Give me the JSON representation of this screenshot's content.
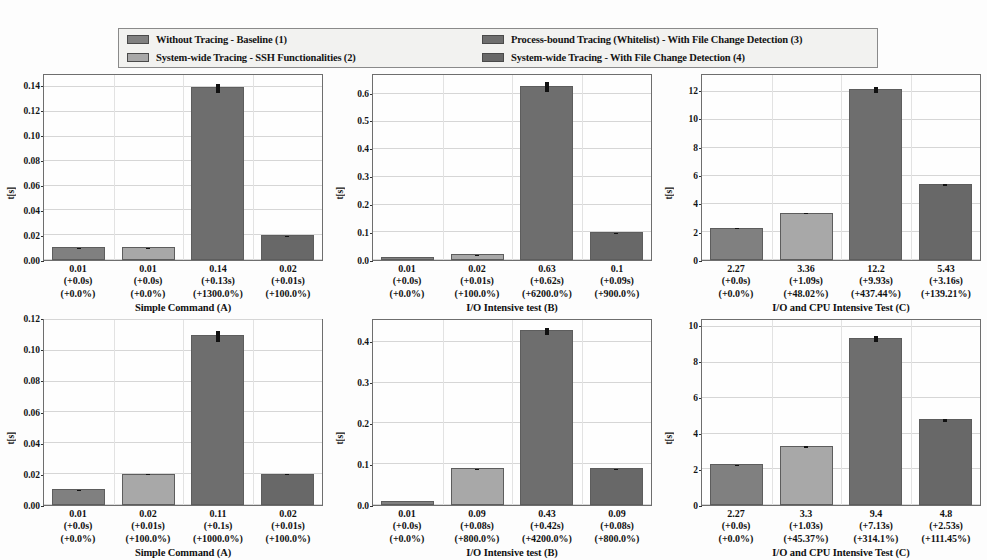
{
  "legend": {
    "entries": [
      {
        "label": "Without Tracing - Baseline (1)",
        "color": "#808080"
      },
      {
        "label": "System-wide Tracing - SSH Functionalities (2)",
        "color": "#a8a8a8"
      },
      {
        "label": "Process-bound Tracing (Whitelist) - With File Change Detection (3)",
        "color": "#6e6e6e"
      },
      {
        "label": "System-wide Tracing - With File Change Detection (4)",
        "color": "#686868"
      }
    ]
  },
  "chart_data": [
    {
      "type": "bar",
      "title": "",
      "xlabel": "Simple Command (A)",
      "ylabel": "t[s]",
      "ylim": [
        0,
        0.15
      ],
      "yticks": [
        0.0,
        0.02,
        0.04,
        0.06,
        0.08,
        0.1,
        0.12,
        0.14
      ],
      "ytick_labels": [
        "0.00",
        "0.02",
        "0.04",
        "0.06",
        "0.08",
        "0.10",
        "0.12",
        "0.14"
      ],
      "grid": true,
      "categories": [
        "1",
        "2",
        "3",
        "4"
      ],
      "values": [
        0.01,
        0.01,
        0.14,
        0.02
      ],
      "errors": [
        0.001,
        0.001,
        0.004,
        0.001
      ],
      "colors": [
        "#808080",
        "#a8a8a8",
        "#6e6e6e",
        "#686868"
      ],
      "point_labels": [
        {
          "value": "0.01",
          "delta_s": "(+0.0s)",
          "delta_pct": "(+0.0%)"
        },
        {
          "value": "0.01",
          "delta_s": "(+0.0s)",
          "delta_pct": "(+0.0%)"
        },
        {
          "value": "0.14",
          "delta_s": "(+0.13s)",
          "delta_pct": "(+1300.0%)"
        },
        {
          "value": "0.02",
          "delta_s": "(+0.01s)",
          "delta_pct": "(+100.0%)"
        }
      ]
    },
    {
      "type": "bar",
      "title": "",
      "xlabel": "I/O Intensive test (B)",
      "ylabel": "t[s]",
      "ylim": [
        0,
        0.67
      ],
      "yticks": [
        0.0,
        0.1,
        0.2,
        0.3,
        0.4,
        0.5,
        0.6
      ],
      "ytick_labels": [
        "0.0",
        "0.1",
        "0.2",
        "0.3",
        "0.4",
        "0.5",
        "0.6"
      ],
      "grid": true,
      "categories": [
        "1",
        "2",
        "3",
        "4"
      ],
      "values": [
        0.01,
        0.02,
        0.63,
        0.1
      ],
      "errors": [
        0.003,
        0.004,
        0.018,
        0.006
      ],
      "colors": [
        "#808080",
        "#a8a8a8",
        "#6e6e6e",
        "#686868"
      ],
      "point_labels": [
        {
          "value": "0.01",
          "delta_s": "(+0.0s)",
          "delta_pct": "(+0.0%)"
        },
        {
          "value": "0.02",
          "delta_s": "(+0.01s)",
          "delta_pct": "(+100.0%)"
        },
        {
          "value": "0.63",
          "delta_s": "(+0.62s)",
          "delta_pct": "(+6200.0%)"
        },
        {
          "value": "0.1",
          "delta_s": "(+0.09s)",
          "delta_pct": "(+900.0%)"
        }
      ]
    },
    {
      "type": "bar",
      "title": "",
      "xlabel": "I/O and CPU Intensive Test (C)",
      "ylabel": "t[s]",
      "ylim": [
        0,
        13.2
      ],
      "yticks": [
        0,
        2,
        4,
        6,
        8,
        10,
        12
      ],
      "ytick_labels": [
        "0",
        "2",
        "4",
        "6",
        "8",
        "10",
        "12"
      ],
      "grid": true,
      "categories": [
        "1",
        "2",
        "3",
        "4"
      ],
      "values": [
        2.27,
        3.36,
        12.2,
        5.43
      ],
      "errors": [
        0.16,
        0.22,
        0.22,
        0.2
      ],
      "colors": [
        "#808080",
        "#a8a8a8",
        "#6e6e6e",
        "#686868"
      ],
      "point_labels": [
        {
          "value": "2.27",
          "delta_s": "(+0.0s)",
          "delta_pct": "(+0.0%)"
        },
        {
          "value": "3.36",
          "delta_s": "(+1.09s)",
          "delta_pct": "(+48.02%)"
        },
        {
          "value": "12.2",
          "delta_s": "(+9.93s)",
          "delta_pct": "(+437.44%)"
        },
        {
          "value": "5.43",
          "delta_s": "(+3.16s)",
          "delta_pct": "(+139.21%)"
        }
      ]
    },
    {
      "type": "bar",
      "title": "",
      "xlabel": "Simple Command (A)",
      "ylabel": "t[s]",
      "ylim": [
        0,
        0.12
      ],
      "yticks": [
        0.0,
        0.02,
        0.04,
        0.06,
        0.08,
        0.1,
        0.12
      ],
      "ytick_labels": [
        "0.00",
        "0.02",
        "0.04",
        "0.06",
        "0.08",
        "0.10",
        "0.12"
      ],
      "grid": true,
      "categories": [
        "1",
        "2",
        "3",
        "4"
      ],
      "values": [
        0.01,
        0.02,
        0.11,
        0.02
      ],
      "errors": [
        0.0008,
        0.0008,
        0.004,
        0.0008
      ],
      "colors": [
        "#808080",
        "#a8a8a8",
        "#6e6e6e",
        "#686868"
      ],
      "point_labels": [
        {
          "value": "0.01",
          "delta_s": "(+0.0s)",
          "delta_pct": "(+0.0%)"
        },
        {
          "value": "0.02",
          "delta_s": "(+0.01s)",
          "delta_pct": "(+100.0%)"
        },
        {
          "value": "0.11",
          "delta_s": "(+0.1s)",
          "delta_pct": "(+1000.0%)"
        },
        {
          "value": "0.02",
          "delta_s": "(+0.01s)",
          "delta_pct": "(+100.0%)"
        }
      ]
    },
    {
      "type": "bar",
      "title": "",
      "xlabel": "I/O Intensive test (B)",
      "ylabel": "t[s]",
      "ylim": [
        0,
        0.455
      ],
      "yticks": [
        0.0,
        0.1,
        0.2,
        0.3,
        0.4
      ],
      "ytick_labels": [
        "0.0",
        "0.1",
        "0.2",
        "0.3",
        "0.4"
      ],
      "grid": true,
      "categories": [
        "1",
        "2",
        "3",
        "4"
      ],
      "values": [
        0.01,
        0.09,
        0.43,
        0.09
      ],
      "errors": [
        0.002,
        0.004,
        0.009,
        0.004
      ],
      "colors": [
        "#808080",
        "#a8a8a8",
        "#6e6e6e",
        "#686868"
      ],
      "point_labels": [
        {
          "value": "0.01",
          "delta_s": "(+0.0s)",
          "delta_pct": "(+0.0%)"
        },
        {
          "value": "0.09",
          "delta_s": "(+0.08s)",
          "delta_pct": "(+800.0%)"
        },
        {
          "value": "0.43",
          "delta_s": "(+0.42s)",
          "delta_pct": "(+4200.0%)"
        },
        {
          "value": "0.09",
          "delta_s": "(+0.08s)",
          "delta_pct": "(+800.0%)"
        }
      ]
    },
    {
      "type": "bar",
      "title": "",
      "xlabel": "I/O and CPU Intensive Test (C)",
      "ylabel": "t[s]",
      "ylim": [
        0,
        10.4
      ],
      "yticks": [
        0,
        2,
        4,
        6,
        8,
        10
      ],
      "ytick_labels": [
        "0",
        "2",
        "4",
        "6",
        "8",
        "10"
      ],
      "grid": true,
      "categories": [
        "1",
        "2",
        "3",
        "4"
      ],
      "values": [
        2.27,
        3.3,
        9.4,
        4.8
      ],
      "errors": [
        0.17,
        0.2,
        0.2,
        0.16
      ],
      "colors": [
        "#808080",
        "#a8a8a8",
        "#6e6e6e",
        "#686868"
      ],
      "point_labels": [
        {
          "value": "2.27",
          "delta_s": "(+0.0s)",
          "delta_pct": "(+0.0%)"
        },
        {
          "value": "3.3",
          "delta_s": "(+1.03s)",
          "delta_pct": "(+45.37%)"
        },
        {
          "value": "9.4",
          "delta_s": "(+7.13s)",
          "delta_pct": "(+314.1%)"
        },
        {
          "value": "4.8",
          "delta_s": "(+2.53s)",
          "delta_pct": "(+111.45%)"
        }
      ]
    }
  ]
}
